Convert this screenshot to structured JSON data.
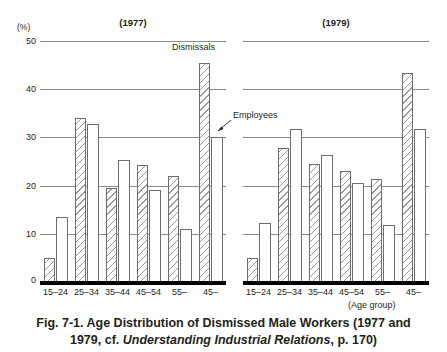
{
  "figure": {
    "unit_label": "(%)",
    "age_group_label": "(Age group)",
    "caption_line1": "Fig. 7-1.  Age Distribution of Dismissed Male Workers (1977 and",
    "caption_line2_pre": "1979, cf. ",
    "caption_line2_italic": "Understanding Industrial Relations",
    "caption_line2_post": ", p. 170)",
    "annotation_dismissals": "Dismissals",
    "annotation_employees": "Employees"
  },
  "panels": [
    {
      "title": "(1977)"
    },
    {
      "title": "(1979)"
    }
  ],
  "axis": {
    "ticks": [
      "50",
      "40",
      "30",
      "20",
      "10",
      "0"
    ],
    "tick_values": [
      50,
      40,
      30,
      20,
      10,
      0
    ]
  },
  "chart_data": {
    "type": "bar",
    "title": "Fig. 7-1. Age Distribution of Dismissed Male Workers (1977 and 1979, cf. Understanding Industrial Relations, p. 170)",
    "xlabel": "(Age group)",
    "ylabel": "(%)",
    "ylim": [
      0,
      50
    ],
    "yticks": [
      0,
      10,
      20,
      30,
      40,
      50
    ],
    "grid": true,
    "legend": [
      "Dismissals",
      "Employees"
    ],
    "legend_position": "inline-annotation",
    "panels": [
      {
        "name": "(1977)",
        "categories": [
          "15–24",
          "25–34",
          "35–44",
          "45–54",
          "55–",
          "45–"
        ],
        "series": [
          {
            "name": "Dismissals",
            "values": [
              5.0,
              34.0,
              19.5,
              24.3,
              22.0,
              45.5
            ]
          },
          {
            "name": "Employees",
            "values": [
              13.5,
              32.8,
              25.3,
              19.0,
              11.0,
              30.0
            ]
          }
        ]
      },
      {
        "name": "(1979)",
        "categories": [
          "15–24",
          "25–34",
          "35–44",
          "45–54",
          "55–",
          "45–"
        ],
        "series": [
          {
            "name": "Dismissals",
            "values": [
              5.0,
              27.8,
              24.5,
              23.0,
              21.3,
              43.3
            ]
          },
          {
            "name": "Employees",
            "values": [
              12.3,
              31.7,
              26.3,
              20.6,
              11.8,
              31.8
            ]
          }
        ]
      }
    ]
  }
}
